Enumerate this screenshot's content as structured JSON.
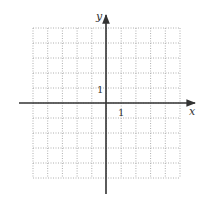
{
  "diagram": {
    "type": "coordinate-grid",
    "grid": {
      "xmin": -5,
      "xmax": 5,
      "ymin": -5,
      "ymax": 5,
      "step": 1,
      "style": "dotted"
    },
    "axes": {
      "x_label": "x",
      "y_label": "y",
      "x_unit_label": "1",
      "y_unit_label": "1"
    },
    "colors": {
      "axis": "#333333",
      "grid": "#9a9a9a",
      "background": "#ffffff"
    }
  }
}
